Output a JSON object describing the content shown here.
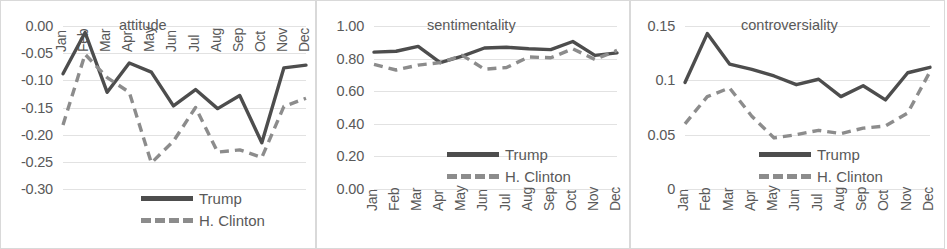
{
  "figure": {
    "legend": {
      "trump_label": "Trump",
      "clinton_label": "H. Clinton"
    },
    "colors": {
      "trump": "#4d4d4d",
      "clinton": "#8c8c8c",
      "grid": "#e2e2e2",
      "text": "#595959"
    }
  },
  "chart_data": [
    {
      "type": "line",
      "title": "attitude",
      "xlabel": "",
      "ylabel": "",
      "grid": true,
      "legend_position": "bottom-right",
      "categories": [
        "Jan",
        "Feb",
        "Mar",
        "Apr",
        "May",
        "Jun",
        "Jul",
        "Aug",
        "Sep",
        "Oct",
        "Nov",
        "Dec"
      ],
      "tick_labels": [
        "0.00",
        "-0.05",
        "-0.10",
        "-0.15",
        "-0.20",
        "-0.25",
        "-0.30"
      ],
      "ticks": [
        0.0,
        -0.05,
        -0.1,
        -0.15,
        -0.2,
        -0.25,
        -0.3
      ],
      "ylim": [
        -0.3,
        0.0
      ],
      "series": [
        {
          "name": "Trump",
          "values": [
            -0.088,
            -0.012,
            -0.122,
            -0.068,
            -0.085,
            -0.147,
            -0.117,
            -0.152,
            -0.128,
            -0.215,
            -0.077,
            -0.072
          ]
        },
        {
          "name": "H. Clinton",
          "values": [
            -0.182,
            -0.052,
            -0.095,
            -0.122,
            -0.252,
            -0.212,
            -0.15,
            -0.232,
            -0.228,
            -0.242,
            -0.148,
            -0.133
          ]
        }
      ]
    },
    {
      "type": "line",
      "title": "sentimentality",
      "xlabel": "",
      "ylabel": "",
      "grid": true,
      "legend_position": "bottom-right",
      "categories": [
        "Jan",
        "Feb",
        "Mar",
        "Apr",
        "May",
        "Jun",
        "Jul",
        "Aug",
        "Sep",
        "Oct",
        "Nov",
        "Dec"
      ],
      "tick_labels": [
        "1.00",
        "0.80",
        "0.60",
        "0.40",
        "0.20",
        "0.00"
      ],
      "ticks": [
        1.0,
        0.8,
        0.6,
        0.4,
        0.2,
        0.0
      ],
      "ylim": [
        0.0,
        1.0
      ],
      "series": [
        {
          "name": "Trump",
          "values": [
            0.84,
            0.845,
            0.875,
            0.775,
            0.815,
            0.865,
            0.87,
            0.86,
            0.855,
            0.905,
            0.82,
            0.835
          ]
        },
        {
          "name": "H. Clinton",
          "values": [
            0.765,
            0.73,
            0.76,
            0.775,
            0.82,
            0.735,
            0.745,
            0.81,
            0.805,
            0.86,
            0.795,
            0.85
          ]
        }
      ]
    },
    {
      "type": "line",
      "title": "controversiality",
      "xlabel": "",
      "ylabel": "",
      "grid": true,
      "legend_position": "bottom-right",
      "categories": [
        "Jan",
        "Feb",
        "Mar",
        "Apr",
        "May",
        "Jun",
        "Jul",
        "Aug",
        "Sep",
        "Oct",
        "Nov",
        "Dec"
      ],
      "tick_labels": [
        "0.15",
        "0.1",
        "0.05",
        "0"
      ],
      "ticks": [
        0.15,
        0.1,
        0.05,
        0
      ],
      "ylim": [
        0,
        0.15
      ],
      "series": [
        {
          "name": "Trump",
          "values": [
            0.098,
            0.143,
            0.115,
            0.11,
            0.104,
            0.096,
            0.101,
            0.085,
            0.095,
            0.082,
            0.107,
            0.112
          ]
        },
        {
          "name": "H. Clinton",
          "values": [
            0.06,
            0.085,
            0.093,
            0.067,
            0.047,
            0.05,
            0.054,
            0.051,
            0.056,
            0.058,
            0.07,
            0.108
          ]
        }
      ]
    }
  ]
}
